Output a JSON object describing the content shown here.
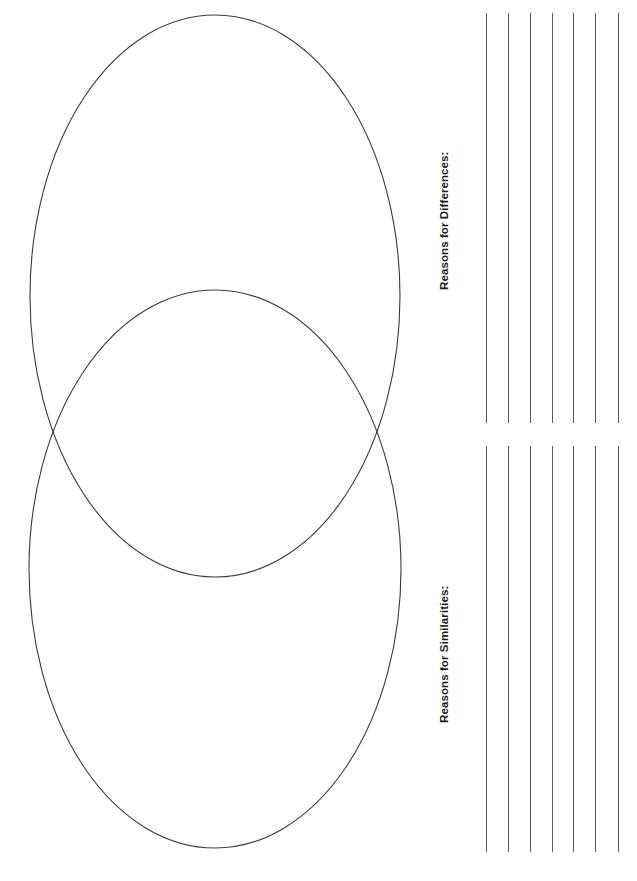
{
  "document": {
    "type": "venn-diagram-worksheet",
    "page_width": 637,
    "page_height": 881,
    "background_color": "#ffffff",
    "orientation": "rotated-90"
  },
  "venn": {
    "stroke_color": "#3a3a3a",
    "stroke_width": 1.1,
    "fill": "none",
    "circles": [
      {
        "name": "top-ellipse",
        "center_x": 215,
        "center_y": 296,
        "radius_x": 185,
        "radius_y": 281
      },
      {
        "name": "bottom-ellipse",
        "center_x": 215,
        "center_y": 569,
        "radius_x": 186,
        "radius_y": 279
      }
    ],
    "intersection_points": [
      {
        "x": 51,
        "y": 434
      },
      {
        "x": 380,
        "y": 434
      }
    ]
  },
  "sections": [
    {
      "id": "differences",
      "label": "Reasons for Differences:",
      "line_count": 7,
      "line_color": "#595959",
      "line_top": 13,
      "line_bottom": 423,
      "line_x_positions": [
        486,
        508,
        530,
        552,
        573,
        595,
        618
      ]
    },
    {
      "id": "similarities",
      "label": "Reasons for Similarities:",
      "line_count": 7,
      "line_color": "#595959",
      "line_top": 446,
      "line_bottom": 852,
      "line_x_positions": [
        486,
        508,
        530,
        552,
        573,
        595,
        618
      ]
    }
  ]
}
